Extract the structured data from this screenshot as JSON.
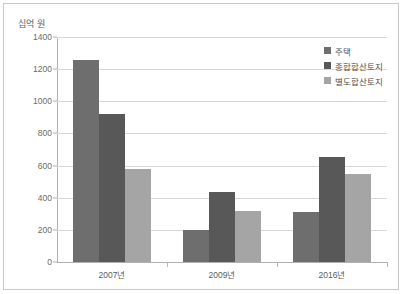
{
  "chart_data": {
    "type": "bar",
    "title": "",
    "xlabel": "",
    "ylabel": "십억 원",
    "categories": [
      "2007년",
      "2009년",
      "2016년"
    ],
    "series": [
      {
        "name": "주택",
        "color": "#6e6e6e",
        "values": [
          1260,
          200,
          310
        ]
      },
      {
        "name": "종합합산토지",
        "color": "#585858",
        "values": [
          920,
          435,
          655
        ]
      },
      {
        "name": "별도합산토지",
        "color": "#a5a5a5",
        "values": [
          580,
          320,
          545
        ]
      }
    ],
    "ylim": [
      0,
      1400
    ],
    "yticks": [
      0,
      200,
      400,
      600,
      800,
      1000,
      1200,
      1400
    ],
    "ytick_labels": [
      "0",
      "200",
      "400",
      "600",
      "800",
      "1000",
      "1200",
      "1400"
    ],
    "grid": true,
    "legend_position": "top-right"
  }
}
